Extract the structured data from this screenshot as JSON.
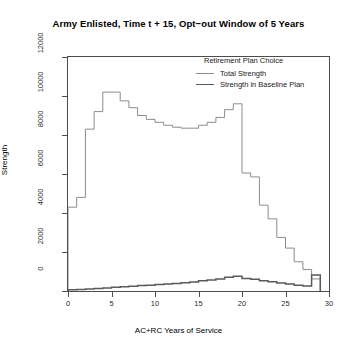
{
  "title": "Army Enlisted, Time t + 15, Opt−out Window of 5 Years",
  "legend": {
    "title": "Retirement Plan Choice",
    "entries": [
      {
        "label": "Total Strength",
        "color": "#8c8c8c",
        "width": 1.0
      },
      {
        "label": "Strength in Baseline Plan",
        "color": "#5a5a5a",
        "width": 1.6
      }
    ]
  },
  "axes": {
    "x_title": "AC+RC Years of Service",
    "y_title": "Strength",
    "x_ticks": [
      "0",
      "5",
      "10",
      "15",
      "20",
      "25",
      "30"
    ],
    "y_ticks": [
      "0",
      "2000",
      "4000",
      "6000",
      "8000",
      "10000",
      "12000"
    ]
  },
  "chart_data": {
    "type": "line",
    "title": "Army Enlisted, Time t + 15, Opt−out Window of 5 Years",
    "subtitle": "",
    "xlabel": "AC+RC Years of Service",
    "ylabel": "Strength",
    "xlim": [
      0,
      30
    ],
    "ylim": [
      0,
      12000
    ],
    "xticks": [
      0,
      5,
      10,
      15,
      20,
      25,
      30
    ],
    "yticks": [
      0,
      2000,
      4000,
      6000,
      8000,
      10000,
      12000
    ],
    "grid": false,
    "legend_title": "Retirement Plan Choice",
    "legend_position": "top-right-inside",
    "step_style": "hv",
    "x": [
      1,
      2,
      3,
      4,
      5,
      6,
      7,
      8,
      9,
      10,
      11,
      12,
      13,
      14,
      15,
      16,
      17,
      18,
      19,
      20,
      21,
      22,
      23,
      24,
      25,
      26,
      27,
      28,
      29
    ],
    "series": [
      {
        "name": "Total Strength",
        "color": "#8c8c8c",
        "values": [
          4300,
          4800,
          8300,
          9200,
          10200,
          10200,
          9750,
          9400,
          9000,
          8800,
          8650,
          8500,
          8400,
          8350,
          8350,
          8500,
          8650,
          8900,
          9300,
          9600,
          6050,
          5850,
          4400,
          3700,
          2750,
          2200,
          1500,
          1100,
          620
        ]
      },
      {
        "name": "Strength in Baseline Plan",
        "color": "#5a5a5a",
        "values": [
          60,
          80,
          100,
          130,
          160,
          190,
          220,
          250,
          280,
          300,
          330,
          360,
          390,
          420,
          460,
          520,
          560,
          620,
          700,
          760,
          640,
          600,
          520,
          470,
          410,
          360,
          300,
          260,
          820
        ]
      }
    ]
  }
}
